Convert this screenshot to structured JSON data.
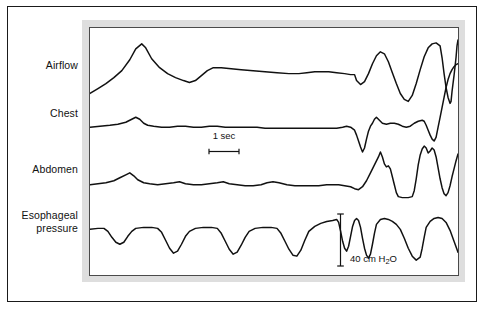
{
  "figure": {
    "type": "polysomnography-recording",
    "background_color": "#ffffff",
    "frame_color": "#1a1a1a",
    "mat_color": "#dedede",
    "trace_color": "#111111"
  },
  "channels": [
    {
      "id": "airflow",
      "label": "Airflow"
    },
    {
      "id": "chest",
      "label": "Chest"
    },
    {
      "id": "abdomen",
      "label": "Abdomen"
    },
    {
      "id": "esophageal_pressure",
      "label": "Esophageal\npressure"
    }
  ],
  "calibrations": {
    "time": {
      "label": "1 sec",
      "orientation": "horizontal"
    },
    "pressure": {
      "label": "40 cm H",
      "label_sub": "2",
      "label_tail": "O",
      "full": "40 cm H2O",
      "orientation": "vertical"
    }
  },
  "chart_data": {
    "type": "line",
    "title": "",
    "xlabel": "",
    "ylabel": "",
    "grid": false,
    "legend": false,
    "axis_ranges": {
      "x": [
        0,
        370
      ],
      "y": [
        0,
        249
      ]
    },
    "annotations": [
      {
        "text": "1 sec",
        "type": "scale-bar",
        "orientation": "horizontal",
        "x": 105,
        "y": 110,
        "length_px": 32
      },
      {
        "text": "40 cm H2O",
        "type": "scale-bar",
        "orientation": "vertical",
        "x": 248,
        "y": 190,
        "length_px": 54
      }
    ],
    "series": [
      {
        "name": "Airflow",
        "stroke": "#111111",
        "baseline_y": 48,
        "points": "0,66 8,61 16,56 24,50 32,43 40,32 46,21 52,16 56,20 62,31 70,40 78,46 86,50 94,53 100,55 106,53 112,48 118,43 124,40 132,40 142,41 152,42 164,43 176,44 188,45 200,46 210,46 218,45 226,44 232,44 240,44 248,45 256,46 262,47 266,47 268,53 272,57 276,54 280,46 284,36 288,28 292,24 296,26 300,34 304,45 308,56 312,66 316,72 320,74 324,68 328,56 332,42 336,29 340,20 344,16 348,15 352,18 354,30 356,46 358,60 360,70 362,76 363,74 364,64 366,48 368,30 369,18 370,12"
      },
      {
        "name": "Chest",
        "stroke": "#111111",
        "baseline_y": 101,
        "points": "0,100 10,99 20,98 28,97 36,95 42,92 46,90 50,92 54,96 58,98 64,99 72,100 80,100 88,99 96,99 104,100 112,100 120,99 128,99 136,100 144,100 152,100 160,100 168,100 176,101 184,101 192,101 200,101 208,101 216,101 224,101 232,101 240,101 248,101 254,100 258,99 262,100 266,103 268,108 270,114 272,120 274,125 276,121 278,112 280,104 282,99 284,96 286,92 288,90 290,92 294,96 298,97 302,96 306,96 310,97 314,99 318,100 322,99 326,96 330,94 334,93 336,94 338,98 340,103 342,108 344,112 346,114 348,110 350,100 352,90 354,80 356,70 358,60 360,52 362,46 364,42 366,39 368,37 370,36"
      },
      {
        "name": "Abdomen",
        "stroke": "#111111",
        "baseline_y": 158,
        "points": "0,158 8,157 16,156 24,154 30,151 36,148 40,146 44,149 48,153 54,156 60,157 68,158 76,157 84,156 90,155 96,157 104,158 112,158 120,157 128,156 134,155 140,157 148,158 156,159 164,159 172,158 178,156 184,155 190,156 198,158 206,159 214,159 222,159 230,159 238,158 244,158 250,158 256,159 262,160 266,162 270,163 274,160 278,154 282,146 286,138 290,130 292,125 294,130 296,137 298,140 300,139 302,142 304,150 306,158 308,166 310,170 314,171 320,171 324,170 326,164 328,152 330,138 332,128 334,122 336,119 338,121 340,126 342,124 344,121 346,123 348,130 350,141 352,152 354,161 356,167 358,169 360,166 362,159 364,150 366,142 368,134 370,127"
      },
      {
        "name": "Esophageal pressure",
        "stroke": "#111111",
        "baseline_y": 202,
        "points": "0,203 8,202 14,202 18,205 22,211 26,216 30,218 34,216 38,210 42,205 46,202 54,201 62,201 68,202 72,206 76,214 80,222 84,227 88,225 92,218 96,210 100,205 106,202 114,201 122,201 128,202 132,207 136,215 140,223 144,228 148,226 152,219 156,211 160,205 166,202 174,201 182,201 188,202 192,207 196,215 200,223 204,229 208,230 212,224 216,214 220,205 226,200 232,197 238,195 244,194 248,193 250,196 252,205 254,215 256,222 258,225 260,220 262,210 264,200 266,194 268,192 270,194 272,201 274,212 276,222 278,229 280,232 282,228 284,218 286,207 288,198 292,193 296,192 300,193 304,195 308,198 312,203 316,212 320,222 324,230 328,234 332,231 334,222 336,211 338,201 342,195 346,192 350,191 354,192 358,196 362,204 366,215 370,226"
      }
    ]
  }
}
